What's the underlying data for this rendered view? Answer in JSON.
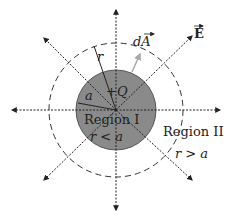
{
  "diagram": {
    "charge_label": "+Q",
    "inner_radius_label": "a",
    "gaussian_radius_label": "r",
    "area_vector_label": "dA",
    "field_label": "E",
    "region1": {
      "name": "Region I",
      "condition": "r < a"
    },
    "region2": {
      "name": "Region II",
      "condition": "r > a"
    },
    "colors": {
      "sphere_fill": "#8a8a8a",
      "sphere_stroke": "#555555",
      "dashed_circle": "#333333",
      "field_arrows": "#222222",
      "area_vector": "#aaaaaa"
    }
  }
}
